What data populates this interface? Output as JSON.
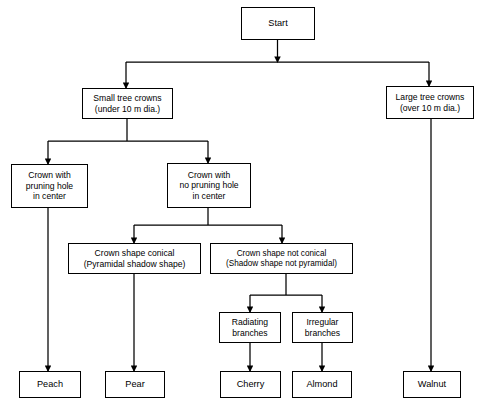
{
  "diagram": {
    "background_color": "#ffffff",
    "line_color": "#000000",
    "text_color": "#000000",
    "nodes": {
      "start": {
        "label": "Start"
      },
      "small_crowns": {
        "label": "Small tree crowns\n(under 10 m dia.)"
      },
      "large_crowns": {
        "label": "Large tree crowns\n(over 10 m dia.)"
      },
      "pruning_hole": {
        "label": "Crown with\npruning hole\nin center"
      },
      "no_pruning_hole": {
        "label": "Crown with\nno pruning hole\nin center"
      },
      "conical": {
        "label": "Crown shape conical\n(Pyramidal shadow shape)"
      },
      "not_conical": {
        "label": "Crown shape not conical\n(Shadow shape not pyramidal)"
      },
      "radiating": {
        "label": "Radiating\nbranches"
      },
      "irregular": {
        "label": "Irregular\nbranches"
      },
      "peach": {
        "label": "Peach"
      },
      "pear": {
        "label": "Pear"
      },
      "cherry": {
        "label": "Cherry"
      },
      "almond": {
        "label": "Almond"
      },
      "walnut": {
        "label": "Walnut"
      }
    }
  }
}
